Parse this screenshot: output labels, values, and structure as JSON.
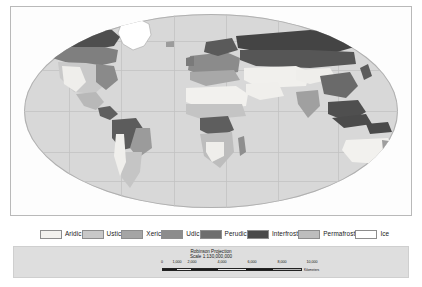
{
  "map": {
    "title": "Soil Moisture Regimes",
    "projection_line1": "Robinson Projection",
    "projection_line2": "Scale 1:130,000,000",
    "background_ocean_color": "#d8d8d8",
    "graticule_color": "#c2c2c2",
    "frame_color": "#b9b9b9"
  },
  "legend": {
    "items": [
      {
        "label": "Aridic",
        "color": "#f2f1ee"
      },
      {
        "label": "Ustic",
        "color": "#c8c8c8"
      },
      {
        "label": "Xeric",
        "color": "#a5a5a5"
      },
      {
        "label": "Udic",
        "color": "#8c8c8c"
      },
      {
        "label": "Perudic",
        "color": "#6e6e6e"
      },
      {
        "label": "Interfrost",
        "color": "#4a4a4a"
      },
      {
        "label": "Permafrost",
        "color": "#bdbdbd"
      },
      {
        "label": "Ice",
        "color": "#ffffff"
      }
    ]
  },
  "scale_bar": {
    "tick_labels": [
      "0",
      "1,000",
      "2,000",
      "4,000",
      "6,000",
      "8,000",
      "10,000"
    ],
    "tick_positions_pct": [
      0,
      10,
      20,
      40,
      60,
      80,
      100
    ],
    "units_label": "Kilometers",
    "segments": [
      {
        "start_pct": 0,
        "end_pct": 10,
        "color": "#1c1c1c"
      },
      {
        "start_pct": 10,
        "end_pct": 20,
        "color": "#e8e8e8"
      },
      {
        "start_pct": 20,
        "end_pct": 40,
        "color": "#1c1c1c"
      },
      {
        "start_pct": 40,
        "end_pct": 60,
        "color": "#e8e8e8"
      },
      {
        "start_pct": 60,
        "end_pct": 80,
        "color": "#1c1c1c"
      },
      {
        "start_pct": 80,
        "end_pct": 100,
        "color": "#b5b5b5"
      }
    ]
  },
  "regions": {
    "greenland_class": "Ice",
    "antarctica_visible": false,
    "continents_shown": [
      "North America",
      "South America",
      "Africa",
      "Europe",
      "Asia",
      "Australia"
    ]
  }
}
